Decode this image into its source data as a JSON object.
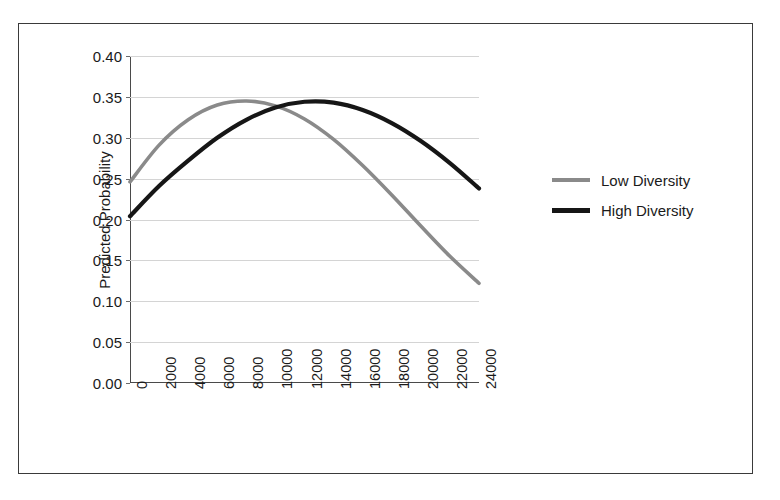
{
  "chart_data": {
    "type": "line",
    "title": "",
    "xlabel": "",
    "ylabel": "Predicted Probability",
    "xlim": [
      0,
      24000
    ],
    "ylim": [
      0.0,
      0.4
    ],
    "grid": true,
    "legend_position": "right",
    "y_ticks": [
      "0.00",
      "0.05",
      "0.10",
      "0.15",
      "0.20",
      "0.25",
      "0.30",
      "0.35",
      "0.40"
    ],
    "y_tick_values": [
      0.0,
      0.05,
      0.1,
      0.15,
      0.2,
      0.25,
      0.3,
      0.35,
      0.4
    ],
    "x_ticks": [
      "0",
      "2000",
      "4000",
      "6000",
      "8000",
      "10000",
      "12000",
      "14000",
      "16000",
      "18000",
      "20000",
      "22000",
      "24000"
    ],
    "x_tick_values": [
      0,
      2000,
      4000,
      6000,
      8000,
      10000,
      12000,
      14000,
      16000,
      18000,
      20000,
      22000,
      24000
    ],
    "x": [
      0,
      2000,
      4000,
      6000,
      8000,
      10000,
      12000,
      14000,
      16000,
      18000,
      20000,
      22000,
      24000
    ],
    "series": [
      {
        "name": "Low Diversity",
        "color": "#8a8a8a",
        "values": [
          0.246,
          0.291,
          0.322,
          0.34,
          0.345,
          0.339,
          0.323,
          0.298,
          0.266,
          0.23,
          0.192,
          0.155,
          0.122
        ]
      },
      {
        "name": "High Diversity",
        "color": "#161616",
        "values": [
          0.204,
          0.241,
          0.272,
          0.3,
          0.322,
          0.337,
          0.344,
          0.343,
          0.334,
          0.318,
          0.296,
          0.269,
          0.238
        ]
      }
    ]
  },
  "legend": {
    "items": [
      {
        "label": "Low Diversity",
        "marker": "line-gray"
      },
      {
        "label": "High Diversity",
        "marker": "line-black"
      }
    ]
  },
  "colors": {
    "low_diversity": "#8a8a8a",
    "high_diversity": "#161616",
    "gridline": "#d4d4d4",
    "axis": "#4a4a4a",
    "frame": "#3a3a3a",
    "background": "#ffffff"
  }
}
